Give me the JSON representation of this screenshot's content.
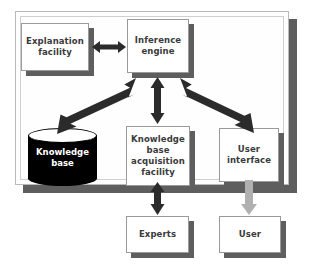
{
  "diagram": {
    "container": {
      "name": "expert-system-boundary"
    },
    "colors": {
      "box_fill": "#ffffff",
      "box_border": "#9a9a9a",
      "box_shadow": "#5e5e5e",
      "frame_fill": "#fefefe",
      "frame_border": "#b9b9b9",
      "arrow_dark": "#2b2b2b",
      "arrow_light": "#b0b0b0",
      "cylinder_fill": "#000000",
      "cylinder_text": "#ffffff",
      "label_text": "#3a3a3a"
    },
    "nodes": [
      {
        "id": "explanation-facility",
        "label": "Explanation\nfacility",
        "shape": "box"
      },
      {
        "id": "inference-engine",
        "label": "Inference\nengine",
        "shape": "box"
      },
      {
        "id": "knowledge-base",
        "label": "Knowledge\nbase",
        "shape": "cylinder"
      },
      {
        "id": "kb-acquisition-facility",
        "label": "Knowledge\nbase\nacquisition\nfacility",
        "shape": "box"
      },
      {
        "id": "user-interface",
        "label": "User\ninterface",
        "shape": "box"
      },
      {
        "id": "experts",
        "label": "Experts",
        "shape": "box"
      },
      {
        "id": "user",
        "label": "User",
        "shape": "box"
      }
    ],
    "edges": [
      {
        "id": "edge-explanation-inference",
        "from": "explanation-facility",
        "to": "inference-engine",
        "direction": "both",
        "color": "dark"
      },
      {
        "id": "edge-inference-knowledgebase",
        "from": "inference-engine",
        "to": "knowledge-base",
        "direction": "both",
        "color": "dark"
      },
      {
        "id": "edge-inference-kbacquisition",
        "from": "inference-engine",
        "to": "kb-acquisition-facility",
        "direction": "both",
        "color": "dark"
      },
      {
        "id": "edge-inference-userinterface",
        "from": "inference-engine",
        "to": "user-interface",
        "direction": "both",
        "color": "dark"
      },
      {
        "id": "edge-kbacquisition-experts",
        "from": "kb-acquisition-facility",
        "to": "experts",
        "direction": "both",
        "color": "dark"
      },
      {
        "id": "edge-userinterface-user",
        "from": "user-interface",
        "to": "user",
        "direction": "down",
        "color": "light"
      }
    ]
  }
}
